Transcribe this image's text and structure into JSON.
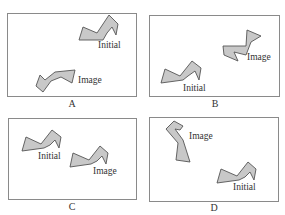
{
  "figure": {
    "colors": {
      "frame_border": "#8a8a8a",
      "shape_fill": "#c8c8c8",
      "shape_stroke": "#555555",
      "text": "#333333"
    },
    "panels": [
      {
        "id": "A",
        "caption": "A",
        "initial_label": "Initial",
        "image_label": "Image"
      },
      {
        "id": "B",
        "caption": "B",
        "initial_label": "Initial",
        "image_label": "Image"
      },
      {
        "id": "C",
        "caption": "C",
        "initial_label": "Initial",
        "image_label": "Image"
      },
      {
        "id": "D",
        "caption": "D",
        "initial_label": "Initial",
        "image_label": "Image"
      }
    ]
  }
}
